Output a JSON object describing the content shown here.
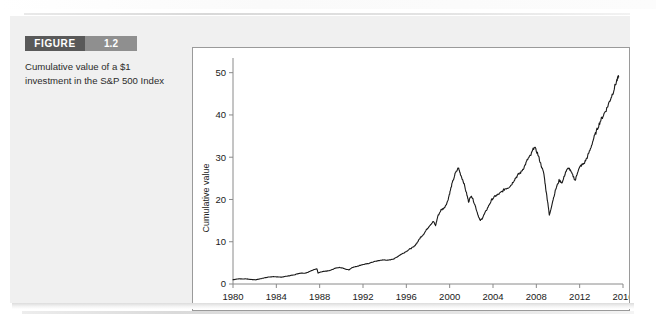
{
  "figure": {
    "badge_label": "FIGURE",
    "number": "1.2",
    "caption": "Cumulative value of a $1 investment in the S&P 500 Index"
  },
  "colors": {
    "badge_dark": "#595959",
    "badge_light": "#8f8f8f",
    "panel": "#f0f0f0",
    "chart_line": "#1a1a1a",
    "axis": "#8a8a8a",
    "frame_border": "#9a9a9a"
  },
  "chart_data": {
    "type": "line",
    "title": "",
    "xlabel": "",
    "ylabel": "Cumulative value",
    "xlim": [
      1980,
      2016
    ],
    "ylim": [
      0,
      53
    ],
    "grid": false,
    "legend": "none",
    "xticks": [
      1980,
      1984,
      1988,
      1992,
      1996,
      2000,
      2004,
      2008,
      2012,
      2016
    ],
    "yticks": [
      0,
      10,
      20,
      30,
      40,
      50
    ],
    "xtick_labels": [
      "1980",
      "1984",
      "1988",
      "1992",
      "1996",
      "2000",
      "2004",
      "2008",
      "2012",
      "2016"
    ],
    "ytick_labels": [
      "0",
      "10",
      "20",
      "30",
      "40",
      "50"
    ],
    "series": [
      {
        "name": "Cumulative value of $1 invested in S&P 500",
        "x": [
          1980.0,
          1980.3,
          1980.6,
          1980.9,
          1981.2,
          1981.5,
          1981.8,
          1982.1,
          1982.4,
          1982.7,
          1983.0,
          1983.3,
          1983.6,
          1983.9,
          1984.2,
          1984.5,
          1984.8,
          1985.1,
          1985.4,
          1985.7,
          1986.0,
          1986.3,
          1986.6,
          1986.9,
          1987.2,
          1987.5,
          1987.75,
          1987.85,
          1988.0,
          1988.3,
          1988.6,
          1988.9,
          1989.2,
          1989.5,
          1989.8,
          1990.1,
          1990.4,
          1990.7,
          1991.0,
          1991.3,
          1991.6,
          1991.9,
          1992.2,
          1992.5,
          1992.8,
          1993.1,
          1993.4,
          1993.7,
          1994.0,
          1994.3,
          1994.6,
          1994.9,
          1995.2,
          1995.5,
          1995.8,
          1996.1,
          1996.4,
          1996.7,
          1997.0,
          1997.3,
          1997.6,
          1997.9,
          1998.2,
          1998.5,
          1998.7,
          1998.9,
          1999.2,
          1999.5,
          1999.8,
          2000.0,
          2000.2,
          2000.5,
          2000.8,
          2001.0,
          2001.3,
          2001.6,
          2001.75,
          2002.0,
          2002.3,
          2002.6,
          2002.8,
          2003.0,
          2003.3,
          2003.6,
          2003.9,
          2004.2,
          2004.5,
          2004.8,
          2005.1,
          2005.4,
          2005.7,
          2006.0,
          2006.3,
          2006.6,
          2006.9,
          2007.2,
          2007.5,
          2007.8,
          2008.1,
          2008.4,
          2008.7,
          2008.9,
          2009.1,
          2009.2,
          2009.5,
          2009.8,
          2010.1,
          2010.4,
          2010.7,
          2011.0,
          2011.3,
          2011.6,
          2011.8,
          2012.1,
          2012.4,
          2012.7,
          2013.0,
          2013.3,
          2013.6,
          2013.9,
          2014.2,
          2014.5,
          2014.8,
          2015.1,
          2015.4,
          2015.6
        ],
        "y": [
          1.0,
          1.15,
          1.25,
          1.18,
          1.22,
          1.12,
          1.05,
          1.0,
          1.15,
          1.35,
          1.5,
          1.65,
          1.72,
          1.7,
          1.68,
          1.62,
          1.78,
          1.9,
          2.05,
          2.2,
          2.45,
          2.6,
          2.55,
          2.75,
          3.1,
          3.45,
          3.6,
          2.6,
          2.75,
          2.95,
          3.05,
          3.15,
          3.45,
          3.8,
          3.9,
          3.8,
          3.5,
          3.35,
          3.9,
          4.1,
          4.3,
          4.55,
          4.7,
          4.85,
          5.1,
          5.35,
          5.5,
          5.65,
          5.7,
          5.6,
          5.8,
          6.0,
          6.5,
          7.0,
          7.4,
          7.9,
          8.4,
          8.8,
          9.8,
          11.0,
          11.8,
          13.0,
          14.0,
          14.8,
          13.8,
          16.0,
          17.5,
          18.0,
          19.5,
          21.5,
          23.5,
          26.0,
          27.5,
          26.0,
          24.0,
          21.0,
          19.5,
          21.0,
          19.0,
          16.5,
          15.0,
          15.5,
          17.0,
          18.5,
          20.0,
          20.8,
          21.2,
          21.8,
          22.5,
          22.8,
          23.5,
          24.8,
          25.8,
          26.5,
          27.8,
          29.5,
          30.5,
          32.5,
          31.0,
          28.5,
          26.0,
          22.0,
          18.5,
          16.2,
          19.5,
          22.5,
          24.5,
          24.0,
          26.5,
          27.5,
          26.0,
          24.5,
          26.5,
          28.0,
          28.5,
          30.0,
          32.0,
          34.5,
          36.5,
          38.5,
          40.0,
          41.5,
          43.5,
          45.5,
          48.0,
          49.0
        ]
      }
    ]
  }
}
